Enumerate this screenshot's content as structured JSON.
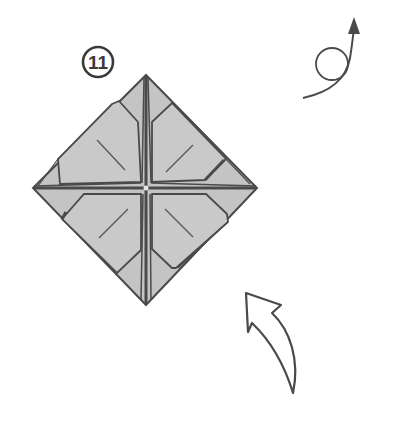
{
  "diagram": {
    "type": "origami-instruction-step",
    "step": {
      "number": "11",
      "marker": "circled-step-number"
    },
    "symbols": [
      {
        "name": "turn-over-symbol",
        "meaning": "turn the model over"
      },
      {
        "name": "fold-direction-arrow",
        "meaning": "fold / lift flap upward"
      }
    ],
    "model": {
      "shape": "square-base-diamond",
      "description": "Square paper rotated 45 degrees with four inner flaps folded toward the center, creases meeting at the center point",
      "flaps": 4,
      "crease_marks": 4
    },
    "colors": {
      "paper_fill": "#c4c4c4",
      "outline": "#4a4a4a",
      "background": "#ffffff",
      "arrow_stroke": "#4a4a4a"
    }
  }
}
